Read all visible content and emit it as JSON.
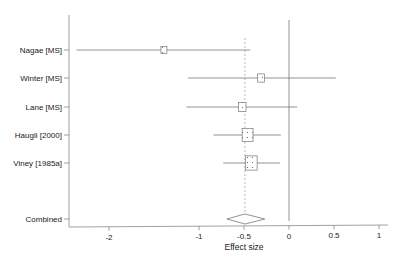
{
  "chart_data": {
    "type": "forest",
    "title": "",
    "xlabel": "Effect size",
    "ylabel": "",
    "xlim": [
      -2.4,
      1.1
    ],
    "x_ticks": [
      -2,
      -1,
      -0.5,
      0,
      0.5,
      1
    ],
    "x_tick_labels": [
      "-2",
      "-1",
      "-0.5",
      "0",
      "0.5",
      "1"
    ],
    "grid": false,
    "reference_line": 0,
    "pooled_line": -0.49,
    "studies": [
      {
        "label": "Nagae [MS]",
        "effect": -1.39,
        "ci_low": -2.36,
        "ci_high": -0.43,
        "weight": 1.0
      },
      {
        "label": "Winter [MS]",
        "effect": -0.31,
        "ci_low": -1.12,
        "ci_high": 0.52,
        "weight": 1.3
      },
      {
        "label": "Lane [MS]",
        "effect": -0.52,
        "ci_low": -1.14,
        "ci_high": 0.09,
        "weight": 1.6
      },
      {
        "label": "Haugli [2000]",
        "effect": -0.46,
        "ci_low": -0.84,
        "ci_high": -0.09,
        "weight": 3.3
      },
      {
        "label": "Viney [1985a]",
        "effect": -0.42,
        "ci_low": -0.73,
        "ci_high": -0.1,
        "weight": 3.9
      }
    ],
    "combined": {
      "label": "Combined",
      "effect": -0.49,
      "ci_low": -0.69,
      "ci_high": -0.27
    }
  }
}
